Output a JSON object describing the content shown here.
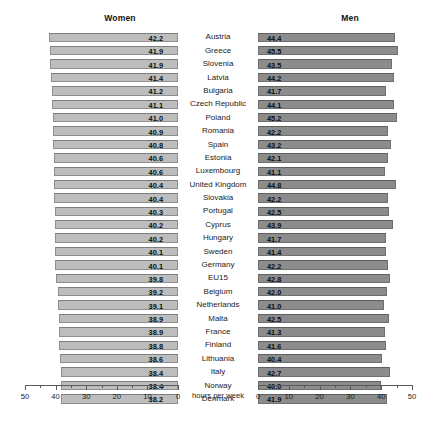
{
  "chart_data": {
    "type": "bar",
    "title": "",
    "orientation": "horizontal",
    "layout": "back-to-back (diverging) paired bar chart",
    "xlabel": "hours per week",
    "ylabel": "",
    "grid": false,
    "legend": "none",
    "panels": [
      {
        "name": "women",
        "title": "Women",
        "direction": "right-to-left",
        "axis_ticks": [
          50,
          40,
          30,
          20,
          10,
          0
        ],
        "xlim": [
          50,
          0
        ],
        "minor_tick_step": 5,
        "bar_color": "#bdbdbd"
      },
      {
        "name": "men",
        "title": "Men",
        "direction": "left-to-right",
        "axis_ticks": [
          0,
          10,
          20,
          30,
          40,
          50
        ],
        "xlim": [
          0,
          50
        ],
        "minor_tick_step": 5,
        "bar_color": "#8c8c8c"
      }
    ],
    "categories": [
      "Austria",
      "Greece",
      "Slovenia",
      "Latvia",
      "Bulgaria",
      "Czech Republic",
      "Poland",
      "Romania",
      "Spain",
      "Estonia",
      "Luxembourg",
      "United Kingdom",
      "Slovakia",
      "Portugal",
      "Cyprus",
      "Hungary",
      "Sweden",
      "Germany",
      "EU15",
      "Belgium",
      "Netherlands",
      "Malta",
      "France",
      "Finland",
      "Lithuania",
      "Italy",
      "Norway",
      "Denmark"
    ],
    "series": [
      {
        "name": "Women",
        "values": [
          42.2,
          41.9,
          41.9,
          41.4,
          41.2,
          41.1,
          41.0,
          40.9,
          40.8,
          40.6,
          40.6,
          40.4,
          40.4,
          40.3,
          40.2,
          40.2,
          40.1,
          40.1,
          39.8,
          39.2,
          39.1,
          38.9,
          38.9,
          38.8,
          38.6,
          38.4,
          38.4,
          38.2
        ]
      },
      {
        "name": "Men",
        "values": [
          44.4,
          45.5,
          43.5,
          44.2,
          41.7,
          44.1,
          45.2,
          42.2,
          43.2,
          42.1,
          41.1,
          44.8,
          42.2,
          42.5,
          43.9,
          41.7,
          41.4,
          42.2,
          42.8,
          42.0,
          41.0,
          42.5,
          41.3,
          41.6,
          40.4,
          42.7,
          40.0,
          41.9
        ]
      }
    ]
  }
}
